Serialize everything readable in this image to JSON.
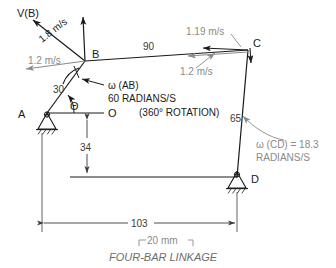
{
  "figure": {
    "caption": "FOUR-BAR LINKAGE",
    "scale_bar_label": "20 mm"
  },
  "joints": {
    "a": "A",
    "b": "B",
    "c": "C",
    "d": "D",
    "o": "O"
  },
  "angles": {
    "theta_symbol": "Θ"
  },
  "link_dimensions": {
    "ab": "30",
    "bc": "90",
    "cd": "65",
    "ad_vertical": "34",
    "ad_horizontal": "103"
  },
  "velocities": {
    "vb_label": "V(B)",
    "vb_magnitude": "1.8 m/s",
    "b_horizontal": "1.2 m/s",
    "c_upper": "1.19 m/s",
    "c_lower": "1.2 m/s"
  },
  "annotations": {
    "omega_ab_name": "ω (AB)",
    "omega_ab_value": "60 RADIANS/S",
    "omega_ab_note": "(360° ROTATION)",
    "omega_cd_line1": "ω (CD) = 18.3",
    "omega_cd_line2": "RADIANS/S"
  },
  "colors": {
    "ink": "#1a1a1a",
    "gray": "#8a8a8a",
    "dim": "#3a3a3a",
    "caption": "#6d6d6d",
    "background": "#ffffff"
  }
}
